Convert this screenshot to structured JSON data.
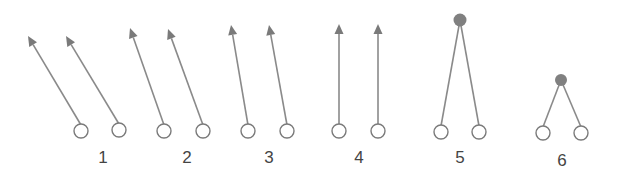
{
  "diagram": {
    "colors": {
      "line": "#8a8a8a",
      "arrowhead": "#7a7a7a",
      "open_circle_stroke": "#7a7a7a",
      "filled_dot": "#808080",
      "label": "#444444"
    },
    "panels": [
      {
        "label": "1",
        "kind": "parallel-arrows",
        "direction": "up-left, steep tilt"
      },
      {
        "label": "2",
        "kind": "parallel-arrows",
        "direction": "up-left, moderate tilt"
      },
      {
        "label": "3",
        "kind": "parallel-arrows",
        "direction": "up-left, slight tilt"
      },
      {
        "label": "4",
        "kind": "parallel-arrows",
        "direction": "vertical up"
      },
      {
        "label": "5",
        "kind": "converging-to-dot",
        "apex": "high"
      },
      {
        "label": "6",
        "kind": "converging-to-dot",
        "apex": "low"
      }
    ]
  }
}
